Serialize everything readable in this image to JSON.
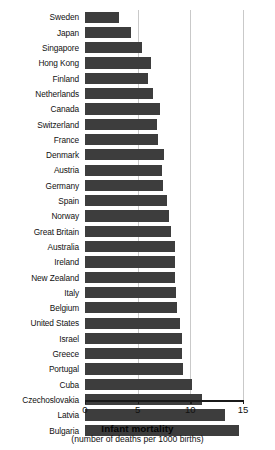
{
  "chart_data": {
    "type": "bar",
    "orientation": "horizontal",
    "title": "Infant mortality",
    "subtitle": "(number of deaths per 1000 births)",
    "xlabel": "Infant mortality",
    "ylabel": "",
    "xlim": [
      0,
      15
    ],
    "xticks": [
      0,
      5,
      10,
      15
    ],
    "xtick_labels": [
      "0",
      "5",
      "10",
      "15"
    ],
    "grid": true,
    "grid_axis": "x",
    "legend": "none",
    "bar_color": "#3d3d3d",
    "categories": [
      "Sweden",
      "Japan",
      "Singapore",
      "Hong Kong",
      "Finland",
      "Netherlands",
      "Canada",
      "Switzerland",
      "France",
      "Denmark",
      "Austria",
      "Germany",
      "Spain",
      "Norway",
      "Great Britain",
      "Australia",
      "Ireland",
      "New Zealand",
      "Italy",
      "Belgium",
      "United States",
      "Israel",
      "Greece",
      "Portugal",
      "Cuba",
      "Czechoslovakia",
      "Latvia",
      "Bulgaria"
    ],
    "values": [
      3.2,
      4.4,
      5.4,
      6.3,
      6.0,
      6.5,
      7.1,
      6.8,
      6.9,
      7.5,
      7.3,
      7.4,
      7.8,
      8.0,
      8.2,
      8.5,
      8.5,
      8.5,
      8.6,
      8.7,
      9.0,
      9.2,
      9.2,
      9.3,
      10.2,
      11.1,
      13.3,
      14.6
    ]
  }
}
